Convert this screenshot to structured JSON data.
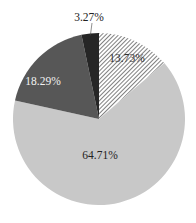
{
  "chart_data": {
    "type": "pie",
    "title": "",
    "start_angle_deg": 0,
    "direction": "clockwise",
    "slices": [
      {
        "label": "13.73%",
        "value": 13.73,
        "fill": "hatch",
        "label_color": "#333333"
      },
      {
        "label": "64.71%",
        "value": 64.71,
        "fill": "#c8c8c8",
        "label_color": "#222222"
      },
      {
        "label": "18.29%",
        "value": 18.29,
        "fill": "#575757",
        "label_color": "#f2f2f2"
      },
      {
        "label": "3.27%",
        "value": 3.27,
        "fill": "#262626",
        "label_color": "#222222"
      }
    ],
    "legend": "none"
  }
}
